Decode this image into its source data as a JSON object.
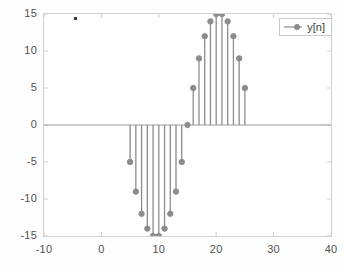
{
  "figure": {
    "background_color": "#ffffff",
    "axes_border_color": "#d2d2d2",
    "tick_label_color": "#515151",
    "artifact": {
      "name": "speck-artifact",
      "x": 74,
      "y": 17,
      "color": "#3a3a3a"
    }
  },
  "legend": {
    "position": "top-right",
    "entries": [
      {
        "label": "y[n]",
        "color": "#8c8c8c",
        "marker": "circle",
        "line": "solid"
      }
    ]
  },
  "axes": {
    "x_ticks": [
      "-10",
      "0",
      "10",
      "20",
      "30",
      "40"
    ],
    "x_tick_values": [
      -10,
      0,
      10,
      20,
      30,
      40
    ],
    "y_ticks": [
      "15",
      "10",
      "5",
      "0",
      "-5",
      "-10",
      "-15"
    ],
    "y_tick_values": [
      15,
      10,
      5,
      0,
      -5,
      -10,
      -15
    ]
  },
  "chart_data": {
    "type": "line",
    "plot_style": "stem",
    "title": "",
    "xlabel": "",
    "ylabel": "",
    "xlim": [
      -10,
      40
    ],
    "ylim": [
      -15,
      15
    ],
    "grid": false,
    "legend_position": "top-right",
    "series": [
      {
        "name": "y[n]",
        "color": "#8c8c8c",
        "marker": "circle",
        "x": [
          5,
          6,
          7,
          8,
          9,
          10,
          11,
          12,
          13,
          14,
          15,
          16,
          17,
          18,
          19,
          20,
          21,
          22,
          23,
          24,
          25
        ],
        "values": [
          -5,
          -9,
          -12,
          -14,
          -15,
          -15,
          -14,
          -12,
          -9,
          -5,
          0,
          5,
          9,
          12,
          14,
          15,
          15,
          14,
          12,
          9,
          5
        ]
      }
    ]
  }
}
